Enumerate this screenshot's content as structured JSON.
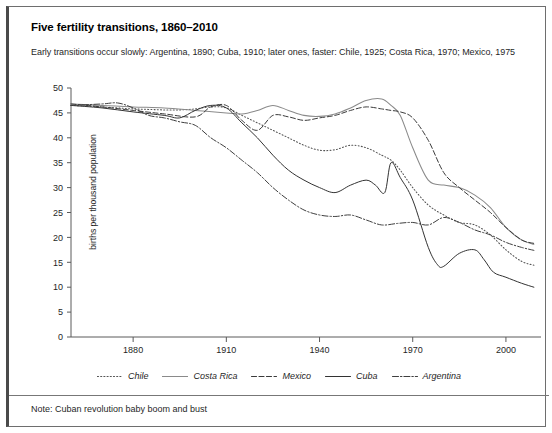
{
  "chart_data": {
    "type": "line",
    "title": "Five fertility transitions, 1860–2010",
    "subtitle": "Early transitions occur slowly:  Argentina, 1890; Cuba, 1910; later ones, faster:  Chile, 1925; Costa Rica, 1970; Mexico, 1975",
    "note": "Note: Cuban revolution baby boom and bust",
    "xlabel": "",
    "ylabel": "births per thousand population",
    "xlim": [
      1860,
      2010
    ],
    "ylim": [
      0,
      50
    ],
    "xticks": [
      1880,
      1910,
      1940,
      1970,
      2000
    ],
    "yticks": [
      0,
      5,
      10,
      15,
      20,
      25,
      30,
      35,
      40,
      45,
      50
    ],
    "grid": false,
    "legend_position": "bottom",
    "series": [
      {
        "name": "Chile",
        "style": "dotted",
        "color": "#555555",
        "x": [
          1860,
          1865,
          1870,
          1875,
          1880,
          1885,
          1890,
          1895,
          1900,
          1905,
          1910,
          1915,
          1920,
          1925,
          1930,
          1935,
          1940,
          1945,
          1950,
          1955,
          1960,
          1963,
          1966,
          1970,
          1975,
          1980,
          1985,
          1990,
          1995,
          2000,
          2005,
          2009
        ],
        "values": [
          46.5,
          46.4,
          46.2,
          46.0,
          45.8,
          45.7,
          45.6,
          45.6,
          45.8,
          46.2,
          46.0,
          44.5,
          43.0,
          41.5,
          40.0,
          38.5,
          37.5,
          37.6,
          38.5,
          38.0,
          36.5,
          35.5,
          33.5,
          30.0,
          26.5,
          24.5,
          23.0,
          22.5,
          20.5,
          17.5,
          15.2,
          14.4
        ]
      },
      {
        "name": "Costa Rica",
        "style": "solid-light",
        "color": "#8a8a8a",
        "x": [
          1860,
          1870,
          1880,
          1890,
          1900,
          1910,
          1915,
          1920,
          1925,
          1930,
          1935,
          1940,
          1945,
          1950,
          1955,
          1960,
          1963,
          1966,
          1970,
          1975,
          1980,
          1985,
          1990,
          1995,
          2000,
          2005,
          2009
        ],
        "values": [
          46.8,
          46.5,
          46.2,
          46.0,
          45.5,
          45.0,
          44.8,
          45.5,
          46.5,
          45.5,
          44.5,
          44.3,
          44.8,
          46.0,
          47.5,
          47.8,
          46.5,
          44.5,
          38.0,
          31.5,
          30.5,
          30.0,
          28.5,
          26.0,
          22.0,
          19.5,
          18.6
        ]
      },
      {
        "name": "Mexico",
        "style": "dashed",
        "color": "#3a3a3a",
        "x": [
          1860,
          1870,
          1880,
          1890,
          1900,
          1905,
          1910,
          1915,
          1920,
          1925,
          1930,
          1935,
          1940,
          1945,
          1950,
          1955,
          1960,
          1963,
          1966,
          1970,
          1975,
          1980,
          1985,
          1990,
          1995,
          2000,
          2005,
          2009
        ],
        "values": [
          46.8,
          46.2,
          45.5,
          44.8,
          44.2,
          46.2,
          46.5,
          43.5,
          41.5,
          44.5,
          44.2,
          43.5,
          44.0,
          44.5,
          45.5,
          46.2,
          45.8,
          45.5,
          45.2,
          44.0,
          39.5,
          33.0,
          30.0,
          27.5,
          25.0,
          22.0,
          19.5,
          18.8
        ]
      },
      {
        "name": "Cuba",
        "style": "solid-dark",
        "color": "#333333",
        "x": [
          1860,
          1870,
          1880,
          1890,
          1895,
          1900,
          1905,
          1910,
          1915,
          1920,
          1925,
          1930,
          1935,
          1940,
          1945,
          1950,
          1955,
          1958,
          1961,
          1963,
          1966,
          1970,
          1975,
          1978,
          1980,
          1985,
          1990,
          1993,
          1996,
          2000,
          2005,
          2009
        ],
        "values": [
          46.5,
          46.0,
          45.2,
          44.5,
          44.0,
          45.5,
          46.5,
          46.0,
          43.0,
          40.0,
          36.5,
          33.5,
          31.5,
          30.0,
          29.0,
          30.5,
          31.5,
          30.5,
          29.0,
          35.0,
          32.0,
          27.5,
          18.0,
          14.5,
          14.2,
          16.8,
          17.5,
          15.5,
          13.0,
          12.0,
          10.8,
          10.0
        ]
      },
      {
        "name": "Argentina",
        "style": "dashdot",
        "color": "#3f3f3f",
        "x": [
          1860,
          1870,
          1875,
          1880,
          1885,
          1890,
          1895,
          1900,
          1905,
          1910,
          1915,
          1920,
          1925,
          1930,
          1935,
          1940,
          1945,
          1950,
          1955,
          1960,
          1965,
          1970,
          1975,
          1980,
          1985,
          1990,
          1995,
          2000,
          2005,
          2009
        ],
        "values": [
          46.5,
          46.8,
          47.0,
          46.0,
          44.5,
          44.0,
          43.2,
          42.5,
          40.0,
          38.0,
          35.5,
          33.0,
          30.0,
          27.5,
          25.5,
          24.5,
          24.2,
          24.5,
          23.5,
          22.5,
          22.8,
          23.0,
          22.5,
          24.0,
          23.0,
          21.5,
          20.5,
          19.0,
          18.0,
          17.4
        ]
      }
    ]
  },
  "legend": {
    "items": [
      {
        "label": "Chile"
      },
      {
        "label": "Costa Rica"
      },
      {
        "label": "Mexico"
      },
      {
        "label": "Cuba"
      },
      {
        "label": "Argentina"
      }
    ]
  }
}
